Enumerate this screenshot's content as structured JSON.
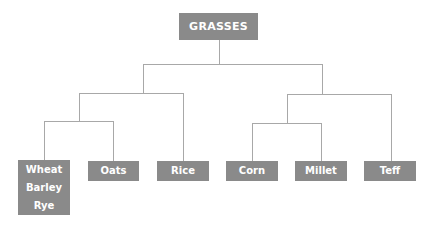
{
  "root": {
    "label": "GRASSES"
  },
  "leaves": [
    {
      "lines": [
        "Wheat",
        "Barley",
        "Rye"
      ]
    },
    {
      "lines": [
        "Oats"
      ]
    },
    {
      "lines": [
        "Rice"
      ]
    },
    {
      "lines": [
        "Corn"
      ]
    },
    {
      "lines": [
        "Millet"
      ]
    },
    {
      "lines": [
        "Teff"
      ]
    }
  ],
  "colors": {
    "node_fill": "#8a8a8a",
    "node_text": "#ffffff",
    "connector": "#a8a8a8"
  }
}
